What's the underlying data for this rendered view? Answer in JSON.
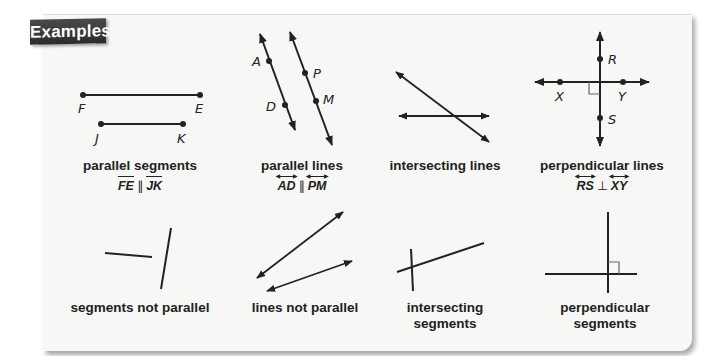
{
  "header": {
    "tab_label": "Examples"
  },
  "examples_row1": [
    {
      "id": "parallel-segments",
      "caption": "parallel segments",
      "notation": {
        "left": "FE",
        "relation": "∥",
        "right": "JK",
        "bar_type": "segment"
      },
      "points": {
        "F": "F",
        "E": "E",
        "J": "J",
        "K": "K"
      }
    },
    {
      "id": "parallel-lines",
      "caption": "parallel lines",
      "notation": {
        "left": "AD",
        "relation": "∥",
        "right": "PM",
        "bar_type": "line"
      },
      "points": {
        "A": "A",
        "D": "D",
        "P": "P",
        "M": "M"
      }
    },
    {
      "id": "intersecting-lines",
      "caption": "intersecting lines"
    },
    {
      "id": "perpendicular-lines",
      "caption": "perpendicular lines",
      "notation": {
        "left": "RS",
        "relation": "⊥",
        "right": "XY",
        "bar_type": "line"
      },
      "points": {
        "R": "R",
        "S": "S",
        "X": "X",
        "Y": "Y"
      }
    }
  ],
  "examples_row2": [
    {
      "id": "segments-not-parallel",
      "caption": "segments not parallel"
    },
    {
      "id": "lines-not-parallel",
      "caption": "lines not parallel"
    },
    {
      "id": "intersecting-segments",
      "caption_line1": "intersecting",
      "caption_line2": "segments"
    },
    {
      "id": "perpendicular-segments",
      "caption_line1": "perpendicular",
      "caption_line2": "segments"
    }
  ],
  "colors": {
    "ink": "#222222",
    "panel": "#f7f7f6",
    "tab": "#333333",
    "right_angle": "#666666"
  }
}
